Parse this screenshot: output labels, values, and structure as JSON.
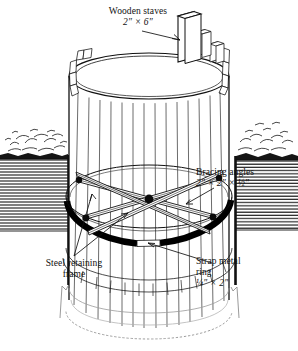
{
  "figure": {
    "width": 298,
    "height": 351,
    "background": "#ffffff",
    "ink_color": "#111111"
  },
  "callouts": {
    "wooden_staves": {
      "line1": "Wooden staves",
      "line2": "2″ × 6″"
    },
    "bracing_angles": {
      "line1": "Bracing angles",
      "line2": "2″ × 2″ × ½″"
    },
    "strap_metal_ring": {
      "line1": "Strap metal",
      "line2": "ring",
      "line3": "¼″ × 2″"
    },
    "steel_retaining_frame": {
      "line1": "Steel retaining",
      "line2": "frame"
    }
  },
  "components": {
    "tank": {
      "name": "wooden stave cistern",
      "stave_count": 17,
      "shape": "cylinder"
    },
    "ground": {
      "name": "earth ground section",
      "hatch": "horizontal-line-hatch",
      "sides": [
        "left",
        "right"
      ]
    },
    "ring": {
      "name": "strap metal ring",
      "color": "#000000",
      "style": "solid filled arc with gap"
    },
    "bracing": {
      "name": "cross bracing angles",
      "arrangement": "X-cross",
      "members": 4
    }
  }
}
